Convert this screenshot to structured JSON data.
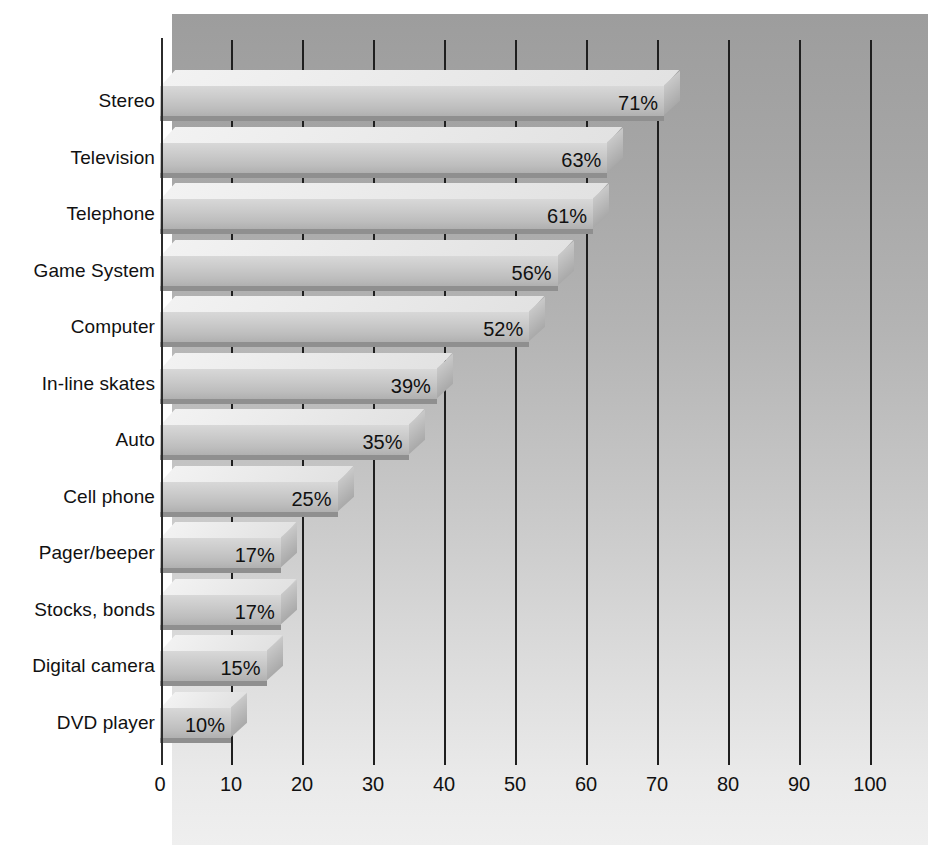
{
  "chart_data": {
    "type": "bar",
    "orientation": "horizontal",
    "title": "",
    "subtitle": "",
    "xlabel": "",
    "ylabel": "",
    "xlim": [
      0,
      100
    ],
    "xticks": [
      "0",
      "10",
      "20",
      "30",
      "40",
      "50",
      "60",
      "70",
      "80",
      "90",
      "100"
    ],
    "xtick_values": [
      0,
      10,
      20,
      30,
      40,
      50,
      60,
      70,
      80,
      90,
      100
    ],
    "grid": "vertical",
    "legend": "none",
    "value_suffix": "%",
    "categories": [
      "Stereo",
      "Television",
      "Telephone",
      "Game System",
      "Computer",
      "In-line skates",
      "Auto",
      "Cell phone",
      "Pager/beeper",
      "Stocks, bonds",
      "Digital camera",
      "DVD player"
    ],
    "values": [
      71,
      63,
      61,
      56,
      52,
      39,
      35,
      25,
      17,
      17,
      15,
      10
    ],
    "value_labels": [
      "71%",
      "63%",
      "61%",
      "56%",
      "52%",
      "39%",
      "35%",
      "25%",
      "17%",
      "17%",
      "15%",
      "10%"
    ],
    "style": {
      "bar_face_color": "#cccccc",
      "bar_top_color": "#efefef",
      "bar_side_color": "#b8b8b8",
      "bar_shadow_color": "#8f8f8f",
      "panel_top_color": "#9d9d9d",
      "panel_bottom_color": "#efefef",
      "axis_color": "#1f1f1f",
      "text_color": "#111111",
      "effect": "3d-extruded"
    }
  }
}
